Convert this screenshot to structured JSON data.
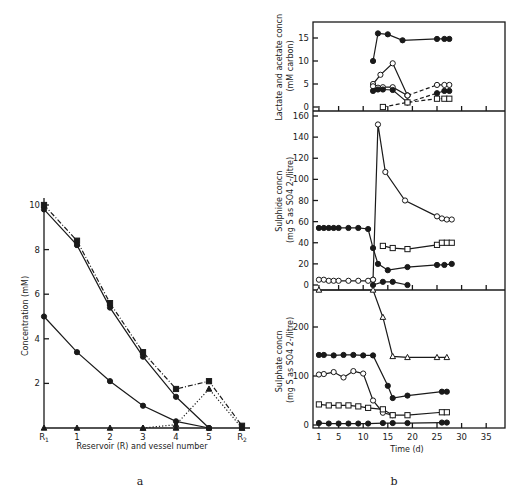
{
  "figure": {
    "panel_a_caption": "a",
    "panel_b_caption": "b"
  },
  "chart_data": [
    {
      "id": "a",
      "type": "line",
      "title": "",
      "xlabel": "Reservoir (R) and vessel number",
      "ylabel": "Concentration (mM)",
      "categories": [
        "R1",
        "1",
        "2",
        "3",
        "4",
        "5",
        "R2"
      ],
      "yticks": [
        2,
        4,
        6,
        8,
        10
      ],
      "ylim": [
        0,
        10.5
      ],
      "grid": false,
      "series": [
        {
          "name": "solid filled circles (upper)",
          "style": "solid",
          "marker": "filled-circle",
          "values": [
            9.8,
            8.2,
            5.4,
            3.2,
            1.4,
            0.0,
            null
          ]
        },
        {
          "name": "dash-dot filled squares",
          "style": "dashdot",
          "marker": "filled-square",
          "values": [
            10.0,
            8.4,
            5.6,
            3.4,
            1.75,
            2.1,
            0.1
          ]
        },
        {
          "name": "solid filled circles (lower)",
          "style": "solid",
          "marker": "filled-circle",
          "values": [
            5.0,
            3.4,
            2.1,
            1.0,
            0.3,
            0.0,
            null
          ]
        },
        {
          "name": "dotted triangles",
          "style": "dotted",
          "marker": "filled-triangle",
          "values": [
            null,
            null,
            null,
            0.0,
            0.15,
            1.75,
            0.0
          ]
        },
        {
          "name": "baseline triangles",
          "style": "none",
          "marker": "filled-triangle",
          "values": [
            0,
            0,
            0,
            0,
            0,
            0,
            0
          ]
        }
      ]
    },
    {
      "id": "b-top",
      "type": "line",
      "ylabel": "Lactate and acetate concn (mM carbon)",
      "xlabel": "",
      "yticks": [
        0,
        5,
        10,
        15
      ],
      "ylim": [
        0,
        17
      ],
      "xlim": [
        0,
        38
      ],
      "series": [
        {
          "name": "lactate/acetate filled (top)",
          "style": "solid",
          "marker": "filled-circle",
          "x": [
            12,
            13,
            15,
            18,
            25,
            26.5,
            27.5
          ],
          "y": [
            10,
            16,
            15.8,
            14.5,
            14.8,
            14.8,
            14.8
          ]
        },
        {
          "name": "open circles peak",
          "style": "solid",
          "marker": "open-circle",
          "x": [
            12,
            13.5,
            16,
            19
          ],
          "y": [
            5,
            7,
            9.5,
            2.5
          ]
        },
        {
          "name": "open circles low",
          "style": "solid",
          "marker": "open-circle",
          "x": [
            12,
            13,
            14,
            16,
            19
          ],
          "y": [
            4.5,
            4.2,
            4.3,
            4.3,
            2.5
          ]
        },
        {
          "name": "filled circles low",
          "style": "solid",
          "marker": "filled-circle",
          "x": [
            12,
            13,
            14,
            16,
            19
          ],
          "y": [
            3.5,
            3.8,
            3.8,
            3.7,
            1
          ]
        },
        {
          "name": "open circles dashed",
          "style": "dashed",
          "marker": "open-circle",
          "x": [
            19,
            25,
            26.5,
            27.5
          ],
          "y": [
            2.5,
            4.8,
            4.8,
            4.8
          ]
        },
        {
          "name": "filled circles dashed",
          "style": "dashed",
          "marker": "filled-circle",
          "x": [
            19,
            25,
            26.5,
            27.5
          ],
          "y": [
            1,
            3,
            3.5,
            3.5
          ]
        },
        {
          "name": "open squares dashed",
          "style": "dashed",
          "marker": "open-square",
          "x": [
            14,
            19,
            25,
            26.5,
            27.5
          ],
          "y": [
            0,
            1,
            1.8,
            1.8,
            1.8
          ]
        }
      ]
    },
    {
      "id": "b-middle",
      "type": "line",
      "ylabel": "Sulphide concn (mg S as SO4 2-/litre)",
      "xlabel": "",
      "yticks": [
        0,
        20,
        40,
        60,
        80,
        100,
        120,
        140,
        160
      ],
      "ylim": [
        0,
        162
      ],
      "xlim": [
        0,
        38
      ],
      "series": [
        {
          "name": "open circles spike",
          "style": "solid",
          "marker": "open-circle",
          "x": [
            12,
            13,
            14.5,
            18.5,
            25,
            26,
            27,
            28
          ],
          "y": [
            5,
            152,
            107,
            80,
            65,
            63,
            62,
            62
          ]
        },
        {
          "name": "filled circles",
          "style": "solid",
          "marker": "filled-circle",
          "x": [
            1,
            2,
            3,
            4,
            5,
            7,
            9,
            11,
            12,
            13,
            15,
            19,
            25,
            26.5,
            28
          ],
          "y": [
            54,
            54,
            54,
            54,
            54,
            54,
            54,
            53,
            35,
            20,
            14,
            17,
            19,
            19,
            20
          ]
        },
        {
          "name": "open squares",
          "style": "solid",
          "marker": "open-square",
          "x": [
            14,
            16,
            19,
            25,
            26,
            27,
            28
          ],
          "y": [
            37,
            35,
            34,
            38,
            40,
            40,
            40
          ]
        },
        {
          "name": "open circles baseline",
          "style": "solid",
          "marker": "open-circle",
          "x": [
            1,
            2,
            3,
            4,
            5,
            7,
            9,
            11,
            12
          ],
          "y": [
            5,
            5,
            4,
            4,
            4,
            4,
            4,
            4,
            5
          ]
        },
        {
          "name": "filled baseline",
          "style": "solid",
          "marker": "filled-circle",
          "x": [
            12,
            14,
            16,
            19
          ],
          "y": [
            0,
            3,
            3,
            0
          ]
        }
      ]
    },
    {
      "id": "b-bottom",
      "type": "line",
      "ylabel": "Sulphate concn (mg S as SO4 2-/litre)",
      "xlabel": "Time (d)",
      "xticks": [
        1,
        5,
        10,
        15,
        20,
        25,
        30,
        35
      ],
      "yticks": [
        0,
        100,
        200
      ],
      "ylim": [
        0,
        280
      ],
      "xlim": [
        0,
        38
      ],
      "series": [
        {
          "name": "open triangles",
          "style": "solid",
          "marker": "open-triangle",
          "x": [
            1,
            12,
            14,
            16,
            19,
            25,
            27
          ],
          "y": [
            285,
            285,
            220,
            140,
            138,
            138,
            138
          ]
        },
        {
          "name": "filled circles",
          "style": "solid",
          "marker": "filled-circle",
          "x": [
            1,
            2,
            4,
            6,
            8,
            10,
            12,
            15,
            16,
            19,
            26,
            27
          ],
          "y": [
            143,
            143,
            142,
            143,
            143,
            142,
            142,
            80,
            55,
            60,
            68,
            68
          ]
        },
        {
          "name": "open circles",
          "style": "solid",
          "marker": "open-circle",
          "x": [
            1,
            2,
            4,
            6,
            8,
            10,
            12,
            14,
            16
          ],
          "y": [
            103,
            104,
            108,
            97,
            110,
            105,
            50,
            25,
            20
          ]
        },
        {
          "name": "open squares",
          "style": "solid",
          "marker": "open-square",
          "x": [
            1,
            3,
            5,
            7,
            9,
            11,
            14,
            16,
            19,
            26,
            27
          ],
          "y": [
            42,
            40,
            40,
            40,
            38,
            35,
            32,
            20,
            20,
            26,
            26
          ]
        },
        {
          "name": "filled baseline",
          "style": "solid",
          "marker": "filled-circle",
          "x": [
            1,
            3,
            5,
            7,
            9,
            11,
            14,
            16,
            19,
            26,
            27
          ],
          "y": [
            4,
            3,
            3,
            3,
            3,
            3,
            4,
            4,
            4,
            5,
            5
          ]
        }
      ]
    }
  ]
}
